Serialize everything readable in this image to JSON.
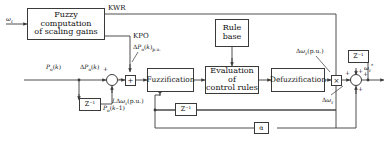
{
  "diagram": {
    "type": "control-block-diagram",
    "stroke_color": "#3a3a3a",
    "background": "#ffffff"
  },
  "blocks": {
    "fuzzy_scaling": "Fuzzy computation\nof scaling gains",
    "rule_base": "Rule\nbase",
    "fuzzification": "Fuzzification",
    "evaluation": "Evaluation of\ncontrol rules",
    "defuzzification": "Defuzzification",
    "delay_po": "Z⁻¹",
    "delay_fb": "Z⁻¹",
    "delay_out": "Z⁻¹",
    "alpha": "α",
    "gain_kwr": "×",
    "gain_kpo": "+"
  },
  "signals": {
    "wr_input": "ωr",
    "kwr": "KWR",
    "kpo": "KPO",
    "dpo_pu": "ΔPo(k)p.u.",
    "po_k": "Po(k)",
    "dpo_k": "ΔPo(k)",
    "po_k1": "Po(k–1)",
    "l_dwr_pu": "LΔωr(p.u.)",
    "dwr_pu": "Δωr(p.u.)",
    "dwr": "Δωr",
    "wr_star": "ωr*"
  },
  "signs": {
    "sum1_plus": "+",
    "sum1_minus": "−",
    "sum2_plus_a": "+",
    "sum2_plus_b": "+",
    "sum2_plus_c": "+",
    "sum2_plus_d": "+"
  }
}
